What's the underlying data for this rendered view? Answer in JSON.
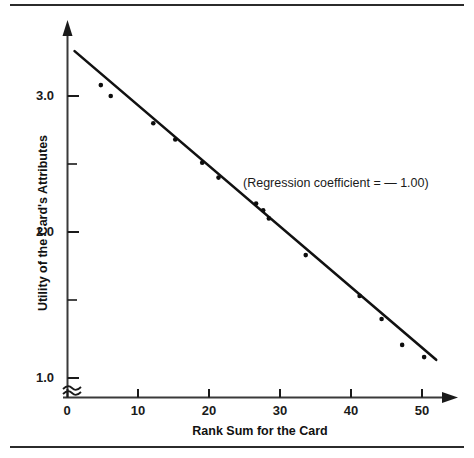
{
  "figure": {
    "top_rule": "",
    "bottom_rule": ""
  },
  "axes": {
    "x": {
      "title": "Rank Sum for the Card",
      "ticks": [
        "0",
        "10",
        "20",
        "30",
        "40",
        "50"
      ],
      "tick_values": [
        0,
        10,
        20,
        30,
        40,
        50
      ],
      "range": [
        0,
        55
      ]
    },
    "y": {
      "title": "Utility of the Card's Attributes",
      "ticks": [
        "3.0",
        "2.0",
        "1.0"
      ],
      "tick_values": [
        3.0,
        2.0,
        1.0
      ],
      "minor_tick_values": [
        2.5,
        1.5
      ],
      "range": [
        1.0,
        3.5
      ],
      "break_symbol": "axis-break-squiggle"
    }
  },
  "annotation": {
    "text": "(Regression coefficient = — 1.00)"
  },
  "chart_data": {
    "type": "scatter",
    "title": "",
    "xlabel": "Rank Sum for the Card",
    "ylabel": "Utility of the Card's Attributes",
    "xlim": [
      0,
      55
    ],
    "ylim": [
      1.0,
      3.5
    ],
    "xticks": [
      0,
      10,
      20,
      30,
      40,
      50
    ],
    "yticks": [
      3.0,
      2.0,
      1.0
    ],
    "grid": false,
    "legend": "none",
    "annotations": [
      "(Regression coefficient = — 1.00)"
    ],
    "points": [
      {
        "x": 4.7,
        "y": 3.08
      },
      {
        "x": 6.1,
        "y": 3.0
      },
      {
        "x": 12.1,
        "y": 2.8
      },
      {
        "x": 15.2,
        "y": 2.68
      },
      {
        "x": 19.0,
        "y": 2.51
      },
      {
        "x": 21.3,
        "y": 2.4
      },
      {
        "x": 26.6,
        "y": 2.21
      },
      {
        "x": 27.6,
        "y": 2.16
      },
      {
        "x": 28.4,
        "y": 2.1
      },
      {
        "x": 33.6,
        "y": 1.83
      },
      {
        "x": 41.2,
        "y": 1.53
      },
      {
        "x": 44.3,
        "y": 1.36
      },
      {
        "x": 47.2,
        "y": 1.17
      },
      {
        "x": 50.3,
        "y": 1.08
      }
    ],
    "fit_line": {
      "label": "regression line",
      "slope": -0.0465,
      "intercept": 3.38,
      "x_start": 1.0,
      "x_end": 52.0,
      "y_start": 3.33,
      "y_end": 1.06,
      "regression_coefficient": "-1.00"
    }
  }
}
